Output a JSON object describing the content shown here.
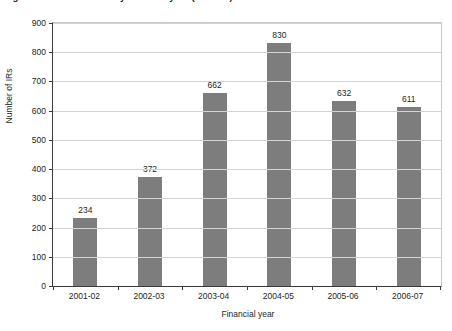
{
  "caption": {
    "text": "Figure 1: Number of IRs by financial year (2001-07)"
  },
  "chart_data": {
    "type": "bar",
    "title": "",
    "xlabel": "Financial year",
    "ylabel": "Number of IRs",
    "categories": [
      "2001-02",
      "2002-03",
      "2003-04",
      "2004-05",
      "2005-06",
      "2006-07"
    ],
    "values": [
      234,
      372,
      662,
      830,
      632,
      611
    ],
    "value_labels": [
      "234",
      "372",
      "662",
      "830",
      "632",
      "611"
    ],
    "ylim": [
      0,
      900
    ],
    "ytick_values": [
      0,
      100,
      200,
      300,
      400,
      500,
      600,
      700,
      800,
      900
    ],
    "ytick_labels": [
      "0",
      "100",
      "200",
      "300",
      "400",
      "500",
      "600",
      "700",
      "800",
      "900"
    ],
    "grid": true,
    "legend": false,
    "bar_color": "#7d7d7d",
    "gridline_color": "#d4d4d4",
    "axis_color": "#3a3a3a",
    "background_color": "#ffffff"
  }
}
